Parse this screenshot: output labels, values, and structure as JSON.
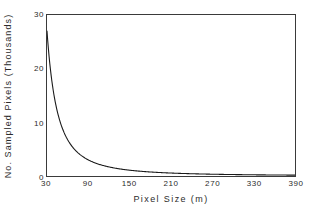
{
  "chart_data": {
    "type": "line",
    "title": "",
    "xlabel": "Pixel Size (m)",
    "ylabel": "No. Sampled Pixels (Thousands)",
    "xlim": [
      30,
      390
    ],
    "ylim": [
      0,
      30
    ],
    "xticks": [
      "30",
      "90",
      "150",
      "210",
      "270",
      "330",
      "390"
    ],
    "xtick_values": [
      30,
      90,
      150,
      210,
      270,
      330,
      390
    ],
    "yticks": [
      "0",
      "10",
      "20",
      "30"
    ],
    "ytick_values": [
      0,
      10,
      20,
      30
    ],
    "grid": false,
    "legend": null,
    "series": [
      {
        "name": "No. Sampled Pixels",
        "color": "#1a1a1a",
        "relation": "N = 27000 * (30 / x)^2, in thousands",
        "x": [
          30,
          35,
          40,
          45,
          50,
          60,
          70,
          80,
          90,
          105,
          120,
          135,
          150,
          170,
          190,
          210,
          240,
          270,
          300,
          330,
          360,
          390
        ],
        "values": [
          27.0,
          19.8,
          15.2,
          12.0,
          9.7,
          6.8,
          5.0,
          3.8,
          3.0,
          2.2,
          1.7,
          1.3,
          1.1,
          0.84,
          0.67,
          0.55,
          0.42,
          0.33,
          0.27,
          0.22,
          0.19,
          0.16
        ]
      }
    ]
  },
  "axis": {
    "x_ticks": [
      {
        "label": "30",
        "value": 30
      },
      {
        "label": "90",
        "value": 90
      },
      {
        "label": "150",
        "value": 150
      },
      {
        "label": "210",
        "value": 210
      },
      {
        "label": "270",
        "value": 270
      },
      {
        "label": "330",
        "value": 330
      },
      {
        "label": "390",
        "value": 390
      }
    ],
    "y_ticks": [
      {
        "label": "0",
        "value": 0
      },
      {
        "label": "10",
        "value": 10
      },
      {
        "label": "20",
        "value": 20
      },
      {
        "label": "30",
        "value": 30
      }
    ],
    "x_title": "Pixel Size (m)",
    "y_title": "No. Sampled Pixels (Thousands)"
  },
  "style": {
    "background": "#ffffff",
    "frame_color": "#3a3a3a",
    "curve_color": "#1a1a1a",
    "text_color": "#2b2b2b"
  }
}
